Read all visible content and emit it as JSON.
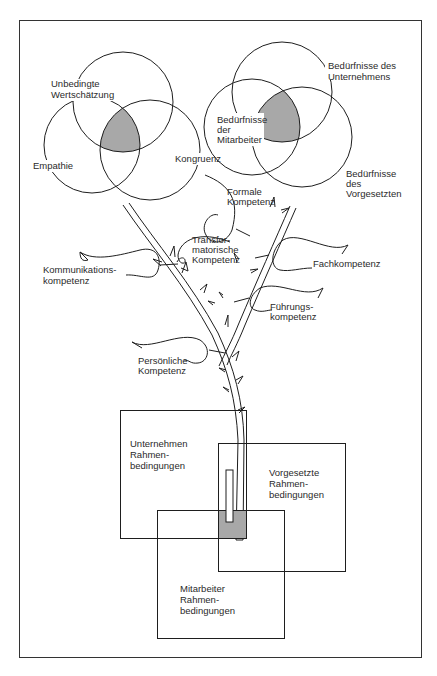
{
  "colors": {
    "line": "#1e1e1e",
    "shade": "#a8a8a8",
    "text": "#2a2a2a",
    "background": "#ffffff"
  },
  "left_venn": {
    "circles": [
      {
        "label_lines": [
          "Unbedingte",
          "Wertschätzung"
        ]
      },
      {
        "label_lines": [
          "Empathie"
        ]
      },
      {
        "label_lines": [
          "Kongruenz"
        ]
      }
    ]
  },
  "right_venn": {
    "circles": [
      {
        "label_lines": [
          "Bedürfnisse des",
          "Unternehmens"
        ]
      },
      {
        "label_lines": [
          "Bedürfnisse",
          "der",
          "Mitarbeiter"
        ]
      },
      {
        "label_lines": [
          "Bedürfnisse",
          "des",
          "Vorgesetzten"
        ]
      }
    ]
  },
  "leaves": [
    {
      "label_lines": [
        "Formale",
        "Kompetenz"
      ]
    },
    {
      "label_lines": [
        "Transfor-",
        "matorische",
        "Kompetenz"
      ]
    },
    {
      "label_lines": [
        "Kommunikations-",
        "kompetenz"
      ]
    },
    {
      "label_lines": [
        "Fachkompetenz"
      ]
    },
    {
      "label_lines": [
        "Führungs-",
        "kompetenz"
      ]
    },
    {
      "label_lines": [
        "Persönliche",
        "Kompetenz"
      ]
    }
  ],
  "boxes": [
    {
      "label_lines": [
        "Unternehmen",
        "Rahmen-",
        "bedingungen"
      ]
    },
    {
      "label_lines": [
        "Vorgesetzte",
        "Rahmen-",
        "bedingungen"
      ]
    },
    {
      "label_lines": [
        "Mitarbeiter",
        "Rahmen-",
        "bedingungen"
      ]
    }
  ]
}
